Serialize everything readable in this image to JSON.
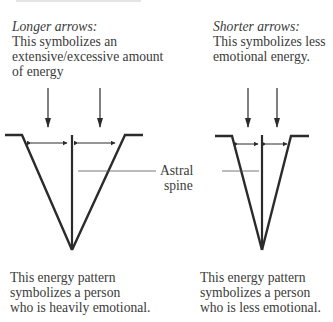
{
  "left_panel": {
    "heading": "Longer arrows:",
    "description_lines": [
      "This symbolizes an",
      "extensive/excessive amount",
      "of energy"
    ],
    "caption_lines": [
      "This energy pattern",
      "symbolizes a person",
      "who is heavily emotional."
    ]
  },
  "right_panel": {
    "heading": "Shorter arrows:",
    "description_lines": [
      "This symbolizes less",
      "emotional energy."
    ],
    "caption_lines": [
      "This energy pattern",
      "symbolizes a person",
      "who is less emotional."
    ]
  },
  "center_label": {
    "lines": [
      "Astral",
      "spine"
    ]
  },
  "colors": {
    "line": "#2b2b2b",
    "text": "#3a3a3a",
    "leader": "#555555"
  }
}
